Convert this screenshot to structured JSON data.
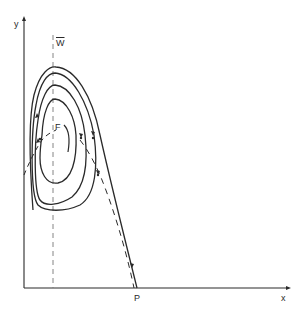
{
  "diagram": {
    "type": "phase-plane",
    "axes": {
      "x_label": "x",
      "y_label": "y"
    },
    "labels": {
      "vertical_line": "W",
      "focus": "F",
      "point": "P"
    },
    "colors": {
      "ink": "#2a2a2a",
      "background": "#ffffff"
    },
    "elements": [
      "y-axis with arrow",
      "x-axis with arrow",
      "dashed vertical line W-bar",
      "closed orbits around focus F",
      "outer separatrix trajectory reaching P",
      "dashed nullcline curves"
    ]
  }
}
